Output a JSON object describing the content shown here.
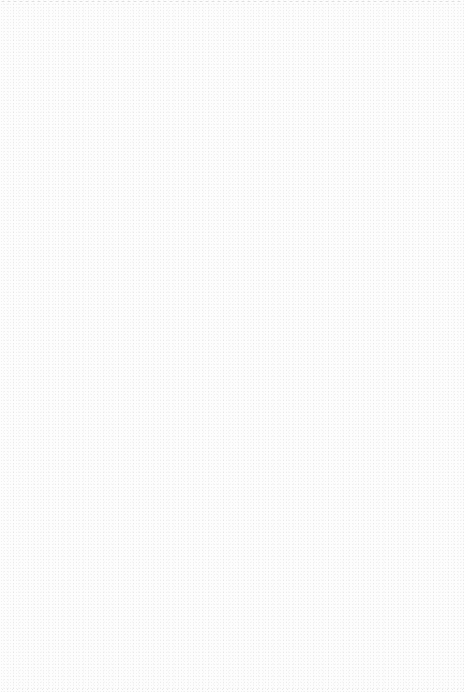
{
  "page": {
    "width": 464,
    "height": 692,
    "background_color": "#fdfdfd",
    "content": "blank page with faint speckle noise"
  }
}
